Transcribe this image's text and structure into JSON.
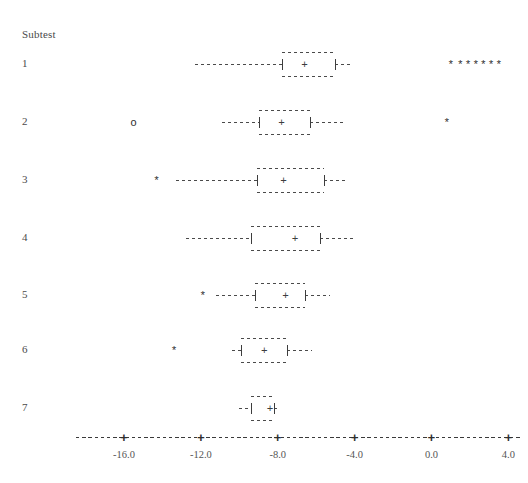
{
  "chart_data": {
    "type": "boxplot",
    "title": "",
    "subtitle": "",
    "group_axis_label": "Subtest",
    "xlabel": "",
    "ylabel": "",
    "xlim": [
      -18.5,
      4.6
    ],
    "xticks": [
      -16.0,
      -12.0,
      -8.0,
      -4.0,
      0.0,
      4.0
    ],
    "xtick_labels": [
      "-16.0",
      "-12.0",
      "-8.0",
      "-4.0",
      "0.0",
      "4.0"
    ],
    "grid": false,
    "legend": null,
    "style": "character-boxplot",
    "categories": [
      "1",
      "2",
      "3",
      "4",
      "5",
      "6",
      "7"
    ],
    "boxes": [
      {
        "label": "1",
        "whisker_low": -12.3,
        "q1": -7.8,
        "median": -6.6,
        "q3": -5.0,
        "whisker_high": -4.2,
        "outliers": [
          {
            "value": 1.0,
            "kind": "extreme"
          },
          {
            "value": 1.5,
            "kind": "extreme"
          },
          {
            "value": 1.9,
            "kind": "extreme"
          },
          {
            "value": 2.3,
            "kind": "extreme"
          },
          {
            "value": 2.7,
            "kind": "extreme"
          },
          {
            "value": 3.1,
            "kind": "extreme"
          },
          {
            "value": 3.5,
            "kind": "extreme"
          }
        ]
      },
      {
        "label": "2",
        "whisker_low": -10.9,
        "q1": -9.0,
        "median": -7.8,
        "q3": -6.3,
        "whisker_high": -4.5,
        "outliers": [
          {
            "value": -15.5,
            "kind": "mild"
          },
          {
            "value": 0.8,
            "kind": "extreme"
          }
        ]
      },
      {
        "label": "3",
        "whisker_low": -13.3,
        "q1": -9.1,
        "median": -7.7,
        "q3": -5.6,
        "whisker_high": -4.4,
        "outliers": [
          {
            "value": -14.3,
            "kind": "extreme"
          }
        ]
      },
      {
        "label": "4",
        "whisker_low": -12.8,
        "q1": -9.4,
        "median": -7.1,
        "q3": -5.8,
        "whisker_high": -4.0,
        "outliers": []
      },
      {
        "label": "5",
        "whisker_low": -11.2,
        "q1": -9.2,
        "median": -7.6,
        "q3": -6.6,
        "whisker_high": -5.3,
        "outliers": [
          {
            "value": -11.9,
            "kind": "extreme"
          }
        ]
      },
      {
        "label": "6",
        "whisker_low": -10.4,
        "q1": -9.9,
        "median": -8.7,
        "q3": -7.5,
        "whisker_high": -6.2,
        "outliers": [
          {
            "value": -13.4,
            "kind": "extreme"
          }
        ]
      },
      {
        "label": "7",
        "whisker_low": -10.0,
        "q1": -9.4,
        "median": -8.4,
        "q3": -8.2,
        "whisker_high": -8.0,
        "outliers": []
      }
    ],
    "glyphs": {
      "median": "+",
      "box_edge": "|",
      "whisker": "-",
      "mild_outlier": "o",
      "extreme_outlier": "*",
      "axis_tick": "+"
    }
  },
  "colors": {
    "background": "#ffffff",
    "ink": "#3d3d3d",
    "label": "#4a4a4a",
    "tick_label": "#555555"
  }
}
